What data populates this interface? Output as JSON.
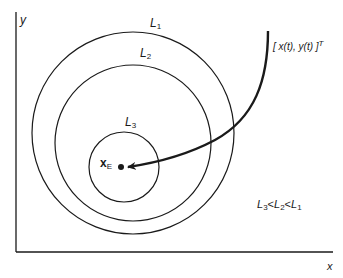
{
  "diagram": {
    "axes": {
      "x_label": "x",
      "y_label": "y"
    },
    "level_sets": [
      {
        "name": "L",
        "sub": "1"
      },
      {
        "name": "L",
        "sub": "2"
      },
      {
        "name": "L",
        "sub": "3"
      }
    ],
    "equilibrium": {
      "name": "x",
      "sub": "E"
    },
    "trajectory": {
      "label": "[ x(t), y(t) ]",
      "sup": "T"
    },
    "relation": {
      "parts": [
        {
          "name": "L",
          "sub": "3"
        },
        {
          "op": "<"
        },
        {
          "name": "L",
          "sub": "2"
        },
        {
          "op": "<"
        },
        {
          "name": "L",
          "sub": "1"
        }
      ]
    },
    "colors": {
      "stroke": "#1a1a1a",
      "background": "#ffffff"
    }
  }
}
